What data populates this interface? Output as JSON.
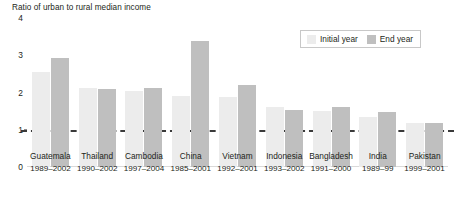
{
  "chart_data": {
    "type": "bar",
    "title": "Ratio of urban to rural median income",
    "xlabel": "",
    "ylabel": "",
    "ylim": [
      0,
      4
    ],
    "yticks": [
      "0",
      "1",
      "2",
      "3",
      "4"
    ],
    "grid": false,
    "legend_position": "top-right",
    "reference_line": {
      "value": 1,
      "style": "dashed",
      "color": "#3a3a3a"
    },
    "categories": [
      "Guatemala",
      "Thailand",
      "Cambodia",
      "China",
      "Vietnam",
      "Indonesia",
      "Bangladesh",
      "India",
      "Pakistan"
    ],
    "periods": [
      "1989–2002",
      "1990–2002",
      "1997–2004",
      "1985–2001",
      "1992–2001",
      "1993–2002",
      "1991–2000",
      "1989–99",
      "1999–2001"
    ],
    "series": [
      {
        "name": "Initial year",
        "color": "#ececec",
        "values": [
          2.55,
          2.13,
          2.03,
          1.9,
          1.87,
          1.6,
          1.5,
          1.33,
          1.17
        ]
      },
      {
        "name": "End year",
        "color": "#bfbfbf",
        "values": [
          2.93,
          2.1,
          2.13,
          3.37,
          2.19,
          1.53,
          1.61,
          1.47,
          1.19
        ]
      }
    ]
  },
  "legend": {
    "entries": [
      {
        "label": "Initial year"
      },
      {
        "label": "End year"
      }
    ]
  }
}
